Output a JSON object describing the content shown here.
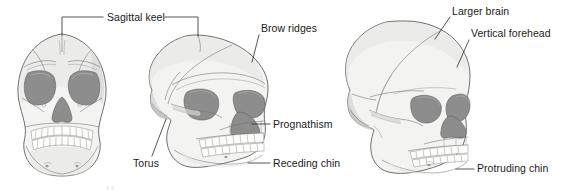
{
  "figure": {
    "background_color": "#ffffff",
    "label_color": "#1a1a1a",
    "bone_fill_color": "#f3f3f1",
    "socket_fill_color": "#8d8d8d",
    "outline_color": "#4a4a4a"
  },
  "labels": {
    "sagittal_keel": "Sagittal keel",
    "brow_ridges": "Brow ridges",
    "prognathism": "Prognathism",
    "receding_chin": "Receding chin",
    "torus": "Torus",
    "larger_brain": "Larger brain",
    "vertical_forehead": "Vertical forehead",
    "protruding_chin": "Protruding chin"
  },
  "specimens": [
    {
      "id": "skull-frontal-left",
      "view": "anterior",
      "features": [
        "sagittal_keel"
      ]
    },
    {
      "id": "skull-archaic-center",
      "view": "three-quarter",
      "features": [
        "sagittal_keel",
        "brow_ridges",
        "prognathism",
        "receding_chin",
        "torus"
      ]
    },
    {
      "id": "skull-modern-right",
      "view": "three-quarter",
      "features": [
        "larger_brain",
        "vertical_forehead",
        "protruding_chin"
      ]
    }
  ],
  "caption": {
    "text": ""
  }
}
